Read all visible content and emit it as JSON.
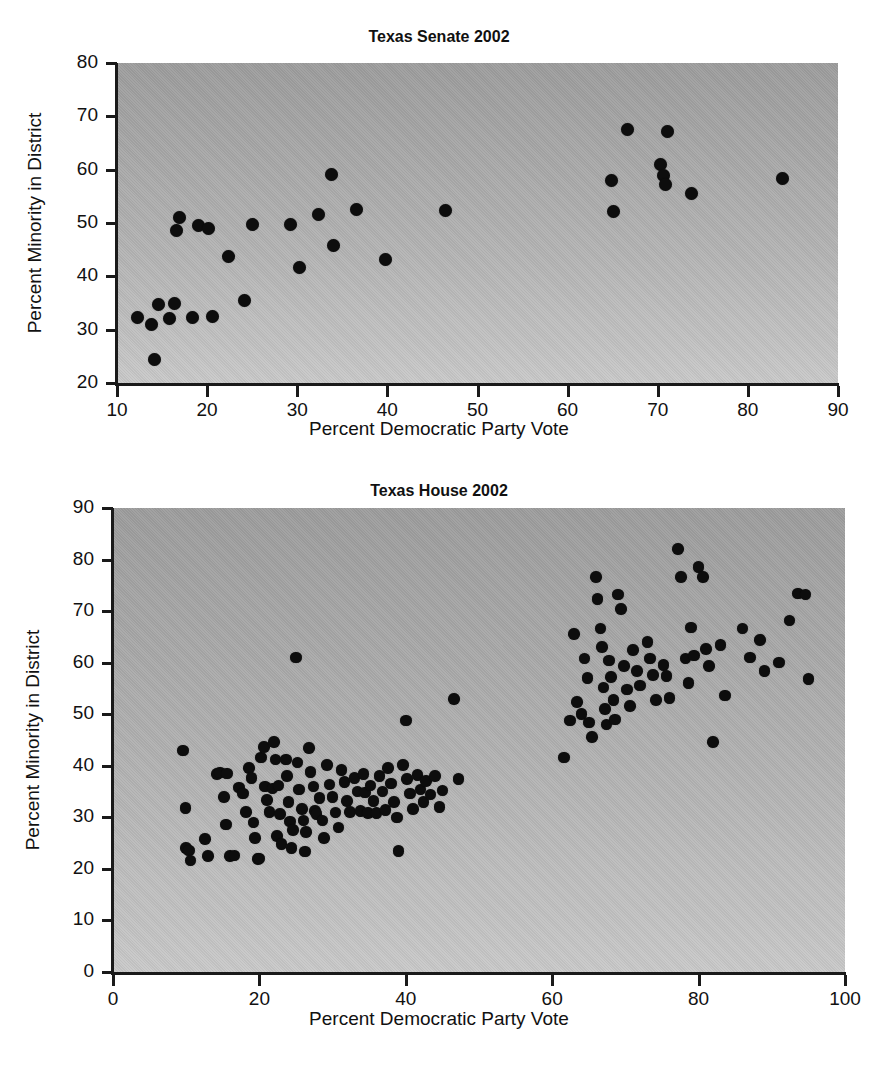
{
  "figure": {
    "background_color": "#ffffff",
    "plot_fill_color": "#b0b0b0",
    "marker_color": "#0d0d0d",
    "axis_color": "#1a1a1a"
  },
  "chart_data": [
    {
      "type": "scatter",
      "id": "texas-senate-2002",
      "title": "Texas Senate 2002",
      "xlabel": "Percent Democratic Party Vote",
      "ylabel": "Percent Minority in District",
      "xlim": [
        10,
        90
      ],
      "ylim": [
        20,
        80
      ],
      "xticks": [
        10,
        20,
        30,
        40,
        50,
        60,
        70,
        80,
        90
      ],
      "yticks": [
        20,
        30,
        40,
        50,
        60,
        70,
        80
      ],
      "grid": false,
      "legend": "none",
      "n_points": 31,
      "points": [
        [
          12.3,
          32.2
        ],
        [
          13.8,
          31.0
        ],
        [
          14.2,
          24.5
        ],
        [
          14.6,
          34.8
        ],
        [
          15.8,
          32.1
        ],
        [
          16.4,
          35.0
        ],
        [
          16.6,
          48.6
        ],
        [
          16.9,
          51.0
        ],
        [
          18.4,
          32.3
        ],
        [
          19.0,
          49.6
        ],
        [
          20.2,
          49.0
        ],
        [
          20.6,
          32.4
        ],
        [
          22.4,
          43.7
        ],
        [
          24.2,
          35.4
        ],
        [
          25.0,
          49.8
        ],
        [
          29.2,
          49.7
        ],
        [
          30.2,
          41.7
        ],
        [
          32.4,
          51.6
        ],
        [
          33.8,
          59.1
        ],
        [
          34.0,
          45.8
        ],
        [
          36.6,
          52.6
        ],
        [
          39.8,
          43.1
        ],
        [
          46.4,
          52.4
        ],
        [
          64.9,
          58.0
        ],
        [
          65.1,
          52.1
        ],
        [
          66.6,
          67.6
        ],
        [
          70.3,
          61.0
        ],
        [
          70.6,
          58.9
        ],
        [
          70.9,
          57.3
        ],
        [
          71.1,
          67.1
        ],
        [
          73.8,
          55.5
        ],
        [
          83.8,
          58.4
        ]
      ]
    },
    {
      "type": "scatter",
      "id": "texas-house-2002",
      "title": "Texas House 2002",
      "xlabel": "Percent Democratic Party Vote",
      "ylabel": "Percent Minority in District",
      "xlim": [
        0,
        100
      ],
      "ylim": [
        0,
        90
      ],
      "xticks": [
        0,
        20,
        40,
        60,
        80,
        100
      ],
      "yticks": [
        0,
        10,
        20,
        30,
        40,
        50,
        60,
        70,
        80,
        90
      ],
      "grid": false,
      "legend": "none",
      "n_points": 150,
      "points": [
        [
          9.6,
          43.0
        ],
        [
          9.9,
          31.8
        ],
        [
          10.0,
          24.0
        ],
        [
          10.4,
          23.6
        ],
        [
          10.6,
          21.6
        ],
        [
          12.6,
          25.8
        ],
        [
          13.0,
          22.5
        ],
        [
          14.2,
          38.4
        ],
        [
          14.6,
          38.7
        ],
        [
          15.2,
          34.0
        ],
        [
          15.6,
          38.5
        ],
        [
          15.4,
          28.6
        ],
        [
          16.0,
          22.5
        ],
        [
          16.6,
          22.6
        ],
        [
          17.2,
          35.8
        ],
        [
          17.8,
          34.6
        ],
        [
          18.2,
          31.0
        ],
        [
          18.6,
          39.6
        ],
        [
          18.9,
          37.6
        ],
        [
          19.2,
          29.0
        ],
        [
          19.4,
          26.0
        ],
        [
          19.8,
          21.9
        ],
        [
          20.0,
          22.0
        ],
        [
          20.2,
          41.6
        ],
        [
          20.6,
          43.6
        ],
        [
          20.8,
          36.0
        ],
        [
          21.0,
          33.4
        ],
        [
          21.4,
          31.0
        ],
        [
          21.8,
          35.6
        ],
        [
          22.0,
          44.6
        ],
        [
          22.2,
          41.2
        ],
        [
          22.6,
          36.2
        ],
        [
          22.8,
          30.6
        ],
        [
          22.4,
          26.4
        ],
        [
          23.0,
          24.8
        ],
        [
          23.6,
          41.2
        ],
        [
          23.8,
          38.0
        ],
        [
          24.0,
          33.0
        ],
        [
          24.2,
          29.2
        ],
        [
          24.6,
          27.6
        ],
        [
          24.4,
          24.0
        ],
        [
          25.0,
          61.0
        ],
        [
          25.2,
          40.6
        ],
        [
          25.4,
          35.4
        ],
        [
          25.8,
          31.6
        ],
        [
          26.0,
          29.4
        ],
        [
          26.4,
          27.2
        ],
        [
          26.2,
          23.4
        ],
        [
          26.8,
          43.4
        ],
        [
          27.0,
          38.8
        ],
        [
          27.4,
          36.0
        ],
        [
          27.6,
          31.2
        ],
        [
          27.8,
          30.6
        ],
        [
          28.2,
          33.8
        ],
        [
          28.6,
          29.4
        ],
        [
          28.8,
          26.0
        ],
        [
          29.2,
          40.2
        ],
        [
          29.6,
          36.4
        ],
        [
          30.0,
          34.0
        ],
        [
          30.4,
          30.9
        ],
        [
          30.8,
          28.0
        ],
        [
          31.2,
          39.2
        ],
        [
          31.6,
          36.8
        ],
        [
          32.0,
          33.2
        ],
        [
          32.4,
          31.0
        ],
        [
          33.0,
          37.6
        ],
        [
          33.4,
          35.0
        ],
        [
          33.8,
          31.2
        ],
        [
          34.2,
          38.4
        ],
        [
          34.4,
          34.8
        ],
        [
          34.8,
          30.8
        ],
        [
          35.2,
          36.2
        ],
        [
          35.6,
          33.2
        ],
        [
          36.0,
          30.8
        ],
        [
          36.4,
          38.0
        ],
        [
          36.8,
          35.0
        ],
        [
          37.2,
          31.4
        ],
        [
          37.6,
          39.6
        ],
        [
          38.0,
          36.6
        ],
        [
          38.4,
          33.0
        ],
        [
          38.8,
          30.0
        ],
        [
          39.0,
          23.5
        ],
        [
          39.6,
          40.2
        ],
        [
          40.0,
          48.8
        ],
        [
          40.2,
          37.4
        ],
        [
          40.6,
          34.6
        ],
        [
          41.0,
          31.6
        ],
        [
          41.6,
          38.2
        ],
        [
          42.0,
          35.4
        ],
        [
          42.4,
          33.0
        ],
        [
          42.8,
          37.0
        ],
        [
          43.4,
          34.4
        ],
        [
          44.0,
          38.0
        ],
        [
          44.6,
          32.0
        ],
        [
          45.0,
          35.2
        ],
        [
          46.6,
          53.0
        ],
        [
          47.2,
          37.4
        ],
        [
          61.6,
          41.6
        ],
        [
          62.4,
          48.8
        ],
        [
          63.0,
          65.6
        ],
        [
          63.4,
          52.4
        ],
        [
          64.0,
          50.0
        ],
        [
          64.4,
          60.8
        ],
        [
          64.8,
          57.0
        ],
        [
          65.0,
          48.4
        ],
        [
          65.4,
          45.6
        ],
        [
          66.0,
          76.6
        ],
        [
          66.2,
          72.4
        ],
        [
          66.6,
          66.6
        ],
        [
          66.8,
          63.0
        ],
        [
          67.0,
          55.2
        ],
        [
          67.2,
          51.0
        ],
        [
          67.4,
          48.0
        ],
        [
          67.8,
          60.4
        ],
        [
          68.0,
          57.2
        ],
        [
          68.4,
          52.8
        ],
        [
          68.6,
          49.0
        ],
        [
          69.0,
          73.2
        ],
        [
          69.4,
          70.4
        ],
        [
          69.8,
          59.4
        ],
        [
          70.2,
          54.8
        ],
        [
          70.6,
          51.6
        ],
        [
          71.0,
          62.4
        ],
        [
          71.6,
          58.4
        ],
        [
          72.0,
          55.6
        ],
        [
          73.0,
          64.0
        ],
        [
          73.4,
          60.8
        ],
        [
          73.8,
          57.6
        ],
        [
          74.2,
          52.8
        ],
        [
          75.2,
          59.6
        ],
        [
          75.6,
          57.4
        ],
        [
          76.0,
          53.2
        ],
        [
          77.2,
          82.0
        ],
        [
          77.6,
          76.6
        ],
        [
          78.2,
          60.8
        ],
        [
          78.6,
          56.0
        ],
        [
          79.0,
          66.8
        ],
        [
          79.4,
          61.4
        ],
        [
          80.0,
          78.6
        ],
        [
          80.6,
          76.6
        ],
        [
          81.0,
          62.6
        ],
        [
          81.4,
          59.4
        ],
        [
          82.0,
          44.6
        ],
        [
          83.0,
          63.4
        ],
        [
          83.6,
          53.6
        ],
        [
          86.0,
          66.6
        ],
        [
          87.0,
          61.0
        ],
        [
          88.4,
          64.4
        ],
        [
          89.0,
          58.4
        ],
        [
          91.0,
          60.0
        ],
        [
          92.4,
          68.2
        ],
        [
          93.6,
          73.4
        ],
        [
          94.6,
          73.2
        ],
        [
          95.0,
          56.8
        ]
      ]
    }
  ]
}
